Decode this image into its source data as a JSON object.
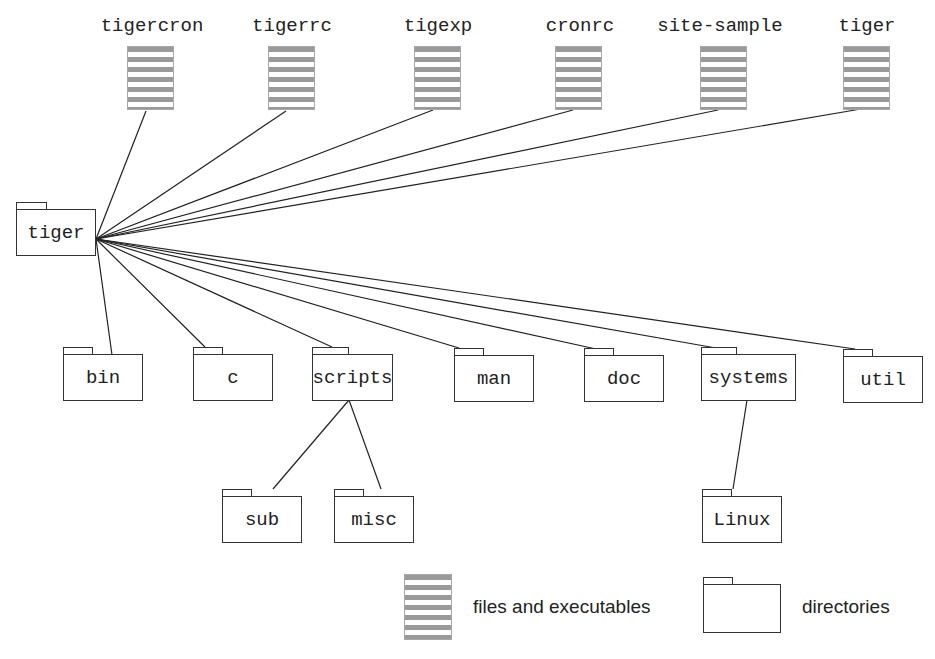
{
  "diagram": {
    "root": {
      "label": "tiger",
      "type": "directory"
    },
    "files": [
      {
        "id": "tigercron",
        "label": "tigercron",
        "type": "file"
      },
      {
        "id": "tigerrc",
        "label": "tigerrc",
        "type": "file"
      },
      {
        "id": "tigexp",
        "label": "tigexp",
        "type": "file"
      },
      {
        "id": "cronrc",
        "label": "cronrc",
        "type": "file"
      },
      {
        "id": "site-sample",
        "label": "site-sample",
        "type": "file"
      },
      {
        "id": "tiger-exec",
        "label": "tiger",
        "type": "file"
      }
    ],
    "directories": [
      {
        "id": "bin",
        "label": "bin",
        "type": "directory"
      },
      {
        "id": "c",
        "label": "c",
        "type": "directory"
      },
      {
        "id": "scripts",
        "label": "scripts",
        "type": "directory"
      },
      {
        "id": "man",
        "label": "man",
        "type": "directory"
      },
      {
        "id": "doc",
        "label": "doc",
        "type": "directory"
      },
      {
        "id": "systems",
        "label": "systems",
        "type": "directory"
      },
      {
        "id": "util",
        "label": "util",
        "type": "directory"
      }
    ],
    "subdirectories": [
      {
        "id": "sub",
        "label": "sub",
        "parent": "scripts",
        "type": "directory"
      },
      {
        "id": "misc",
        "label": "misc",
        "parent": "scripts",
        "type": "directory"
      },
      {
        "id": "linux",
        "label": "Linux",
        "parent": "systems",
        "type": "directory"
      }
    ],
    "edges": [
      [
        "tiger",
        "tigercron"
      ],
      [
        "tiger",
        "tigerrc"
      ],
      [
        "tiger",
        "tigexp"
      ],
      [
        "tiger",
        "cronrc"
      ],
      [
        "tiger",
        "site-sample"
      ],
      [
        "tiger",
        "tiger-exec"
      ],
      [
        "tiger",
        "bin"
      ],
      [
        "tiger",
        "c"
      ],
      [
        "tiger",
        "scripts"
      ],
      [
        "tiger",
        "man"
      ],
      [
        "tiger",
        "doc"
      ],
      [
        "tiger",
        "systems"
      ],
      [
        "tiger",
        "util"
      ],
      [
        "scripts",
        "sub"
      ],
      [
        "scripts",
        "misc"
      ],
      [
        "systems",
        "Linux"
      ]
    ]
  },
  "legend": {
    "files_label": "files and executables",
    "directories_label": "directories",
    "files_icon": "striped-file-icon",
    "directories_icon": "folder-icon"
  },
  "colors": {
    "line": "#222222",
    "folder_border": "#333333",
    "file_stripe": "#9a9a9a",
    "background": "#ffffff"
  }
}
